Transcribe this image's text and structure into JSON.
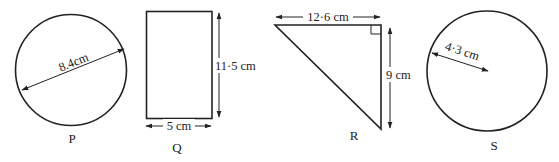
{
  "figure": {
    "type": "geometry-shapes",
    "shapes": [
      {
        "id": "P",
        "kind": "circle",
        "name_label": "P",
        "measurement": {
          "type": "diameter",
          "label": "8.4cm",
          "value": 8.4,
          "unit": "cm"
        }
      },
      {
        "id": "Q",
        "kind": "rectangle",
        "name_label": "Q",
        "measurements": [
          {
            "type": "height",
            "label": "11·5 cm",
            "value": 11.5,
            "unit": "cm"
          },
          {
            "type": "width",
            "label": "5 cm",
            "value": 5,
            "unit": "cm"
          }
        ]
      },
      {
        "id": "R",
        "kind": "right-triangle",
        "name_label": "R",
        "measurements": [
          {
            "type": "base",
            "label": "12·6 cm",
            "value": 12.6,
            "unit": "cm"
          },
          {
            "type": "height",
            "label": "9 cm",
            "value": 9,
            "unit": "cm"
          }
        ]
      },
      {
        "id": "S",
        "kind": "circle",
        "name_label": "S",
        "measurement": {
          "type": "radius",
          "label": "4·3 cm",
          "value": 4.3,
          "unit": "cm"
        }
      }
    ]
  },
  "labels": {
    "p_name": "P",
    "p_diameter": "8.4cm",
    "q_name": "Q",
    "q_height": "11·5 cm",
    "q_width": "5 cm",
    "r_name": "R",
    "r_base": "12·6 cm",
    "r_height": "9 cm",
    "s_name": "S",
    "s_radius": "4·3 cm"
  },
  "colors": {
    "stroke": "#222222",
    "background": "#ffffff"
  }
}
